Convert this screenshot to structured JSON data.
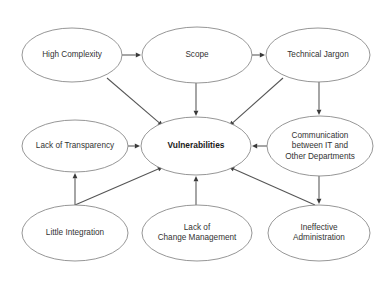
{
  "diagram": {
    "center_node_id": "vulnerabilities",
    "stroke_color": "#8a8a8a",
    "edge_color": "#555555",
    "text_color": "#333333",
    "background_color": "#ffffff",
    "nodes": [
      {
        "id": "high-complexity",
        "label": "High Complexity",
        "lines": [
          "High Complexity"
        ],
        "cx": 72,
        "cy": 55,
        "rx": 50,
        "ry": 27,
        "bold": false
      },
      {
        "id": "scope",
        "label": "Scope",
        "lines": [
          "Scope"
        ],
        "cx": 197,
        "cy": 55,
        "rx": 55,
        "ry": 28,
        "bold": false
      },
      {
        "id": "technical-jargon",
        "label": "Technical Jargon",
        "lines": [
          "Technical Jargon"
        ],
        "cx": 318,
        "cy": 55,
        "rx": 52,
        "ry": 27,
        "bold": false
      },
      {
        "id": "lack-of-transparency",
        "label": "Lack of Transparency",
        "lines": [
          "Lack of Transparency"
        ],
        "cx": 75,
        "cy": 146,
        "rx": 53,
        "ry": 26,
        "bold": false
      },
      {
        "id": "vulnerabilities",
        "label": "Vulnerabilities",
        "lines": [
          "Vulnerabilities"
        ],
        "cx": 196,
        "cy": 146,
        "rx": 55,
        "ry": 29,
        "bold": true
      },
      {
        "id": "communication-it",
        "label": "Communication between IT and Other Departments",
        "lines": [
          "Communication",
          "between IT and",
          "Other Departments"
        ],
        "cx": 320,
        "cy": 146,
        "rx": 53,
        "ry": 30,
        "bold": false
      },
      {
        "id": "little-integration",
        "label": "Little Integration",
        "lines": [
          "Little Integration"
        ],
        "cx": 75,
        "cy": 233,
        "rx": 53,
        "ry": 28,
        "bold": false
      },
      {
        "id": "lack-of-change-management",
        "label": "Lack of Change Management",
        "lines": [
          "Lack of",
          "Change Management"
        ],
        "cx": 197,
        "cy": 233,
        "rx": 55,
        "ry": 28,
        "bold": false
      },
      {
        "id": "ineffective-administration",
        "label": "Ineffective Administration",
        "lines": [
          "Ineffective",
          "Administration"
        ],
        "cx": 319,
        "cy": 233,
        "rx": 51,
        "ry": 28,
        "bold": false
      }
    ],
    "edges": [
      {
        "id": "e1",
        "from": "high-complexity",
        "to": "scope",
        "x1": 122,
        "y1": 55,
        "x2": 141,
        "y2": 55
      },
      {
        "id": "e2",
        "from": "scope",
        "to": "technical-jargon",
        "x1": 252,
        "y1": 55,
        "x2": 265,
        "y2": 55
      },
      {
        "id": "e3",
        "from": "high-complexity",
        "to": "vulnerabilities",
        "x1": 107,
        "y1": 78,
        "x2": 163,
        "y2": 126
      },
      {
        "id": "e4",
        "from": "scope",
        "to": "vulnerabilities",
        "x1": 196,
        "y1": 83,
        "x2": 196,
        "y2": 116
      },
      {
        "id": "e5",
        "from": "technical-jargon",
        "to": "vulnerabilities",
        "x1": 283,
        "y1": 78,
        "x2": 229,
        "y2": 126
      },
      {
        "id": "e6",
        "from": "technical-jargon",
        "to": "communication-it",
        "x1": 319,
        "y1": 82,
        "x2": 319,
        "y2": 115
      },
      {
        "id": "e7",
        "from": "lack-of-transparency",
        "to": "vulnerabilities",
        "x1": 128,
        "y1": 146,
        "x2": 140,
        "y2": 146
      },
      {
        "id": "e8",
        "from": "communication-it",
        "to": "vulnerabilities",
        "x1": 267,
        "y1": 146,
        "x2": 252,
        "y2": 146
      },
      {
        "id": "e9",
        "from": "little-integration",
        "to": "lack-of-transparency",
        "x1": 75,
        "y1": 205,
        "x2": 75,
        "y2": 173
      },
      {
        "id": "e10",
        "from": "little-integration",
        "to": "vulnerabilities",
        "x1": 75,
        "y1": 205,
        "x2": 163,
        "y2": 167
      },
      {
        "id": "e11",
        "from": "lack-of-change-management",
        "to": "vulnerabilities",
        "x1": 196,
        "y1": 205,
        "x2": 196,
        "y2": 176
      },
      {
        "id": "e12",
        "from": "ineffective-administration",
        "to": "vulnerabilities",
        "x1": 315,
        "y1": 205,
        "x2": 229,
        "y2": 167
      },
      {
        "id": "e13",
        "from": "communication-it",
        "to": "ineffective-administration",
        "x1": 319,
        "y1": 176,
        "x2": 319,
        "y2": 204
      }
    ]
  }
}
